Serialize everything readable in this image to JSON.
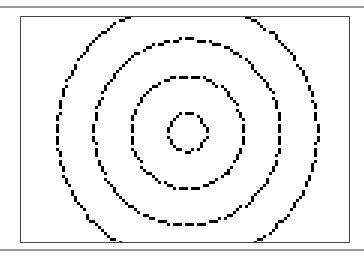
{
  "figure": {
    "center": [
      166,
      115
    ],
    "rings": [
      {
        "radius": 19,
        "dot_spacing": 4
      },
      {
        "radius": 56,
        "dot_spacing": 4
      },
      {
        "radius": 93,
        "dot_spacing": 4
      },
      {
        "radius": 130,
        "dot_spacing": 4
      }
    ],
    "dot_size": 3,
    "dot_color": "#000000",
    "frame_color": "#444444",
    "rule_color": "#9a9a9a"
  }
}
